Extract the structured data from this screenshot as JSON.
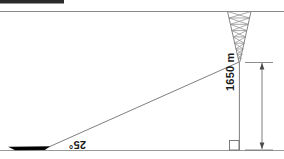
{
  "figure": {
    "type": "trigonometry-elevation-diagram",
    "orientation": "rotated-180",
    "background_color": "#ffffff",
    "line_color": "#6b6b6b",
    "text_color": "#1a1a1a",
    "fill_color": "#000000"
  },
  "labels": {
    "height": "1650 m",
    "angle": "25°"
  },
  "elements": {
    "top_bar_name": "black-header-bar",
    "horizon_line_name": "upper-horizontal-line",
    "ground_line_name": "ground-baseline",
    "tower_name": "lattice-tower",
    "boat_name": "boat-silhouette",
    "hypotenuse_name": "line-of-sight",
    "vertical_name": "tower-height-line",
    "dimension_name": "height-dimension-line",
    "right_angle_name": "right-angle-marker"
  },
  "geometry": {
    "horizon_y": 11,
    "ground_y": 150,
    "tower_apex_x": 239,
    "tower_apex_y": 62,
    "boat_x": 42,
    "height_px": 88,
    "angle_degrees": 25
  }
}
